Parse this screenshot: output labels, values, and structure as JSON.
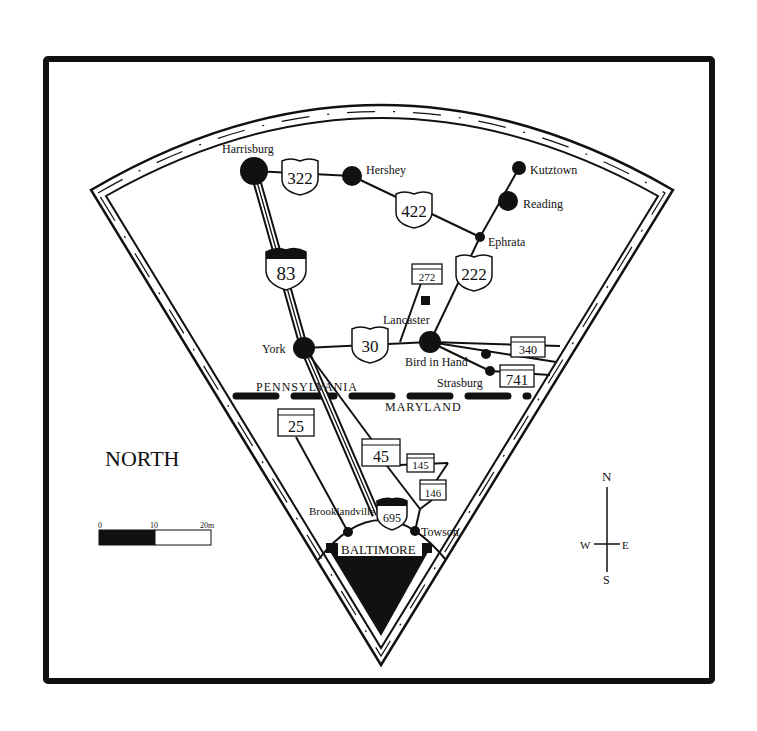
{
  "map": {
    "title": "NORTH",
    "cities": [
      {
        "name": "Harrisburg",
        "x": 254,
        "y": 171,
        "r": 14,
        "lx": 222,
        "ly": 153
      },
      {
        "name": "Hershey",
        "x": 352,
        "y": 176,
        "r": 10,
        "lx": 366,
        "ly": 172
      },
      {
        "name": "Kutztown",
        "x": 519,
        "y": 168,
        "r": 7,
        "lx": 530,
        "ly": 174
      },
      {
        "name": "Reading",
        "x": 508,
        "y": 201,
        "r": 10,
        "lx": 523,
        "ly": 208
      },
      {
        "name": "Ephrata",
        "x": 480,
        "y": 237,
        "r": 5,
        "lx": 488,
        "ly": 246
      },
      {
        "name": "Lancaster",
        "x": 430,
        "y": 342,
        "r": 11,
        "lx": 383,
        "ly": 324
      },
      {
        "name": "York",
        "x": 304,
        "y": 348,
        "r": 11,
        "lx": 262,
        "ly": 353
      },
      {
        "name": "Bird in Hand",
        "x": 486,
        "y": 354,
        "r": 5,
        "lx": 405,
        "ly": 366
      },
      {
        "name": "Strasburg",
        "x": 490,
        "y": 371,
        "r": 5,
        "lx": 437,
        "ly": 387
      },
      {
        "name": "Brooklandville",
        "x": 348,
        "y": 532,
        "r": 5,
        "lx": 309,
        "ly": 515
      },
      {
        "name": "Towson",
        "x": 415,
        "y": 531,
        "r": 5,
        "lx": 421,
        "ly": 536
      }
    ],
    "baltimore_label": "BALTIMORE",
    "state_labels": {
      "north": "PENNSYLVANIA",
      "south": "MARYLAND"
    },
    "route_shields": {
      "us": [
        "322",
        "422",
        "222",
        "30"
      ],
      "interstate": [
        "83",
        "695"
      ],
      "state": [
        "272",
        "340",
        "741",
        "25",
        "45",
        "145",
        "146"
      ]
    },
    "scale_bar": {
      "ticks": [
        "0",
        "10",
        "20m"
      ]
    },
    "compass": {
      "n": "N",
      "s": "S",
      "e": "E",
      "w": "W"
    }
  }
}
